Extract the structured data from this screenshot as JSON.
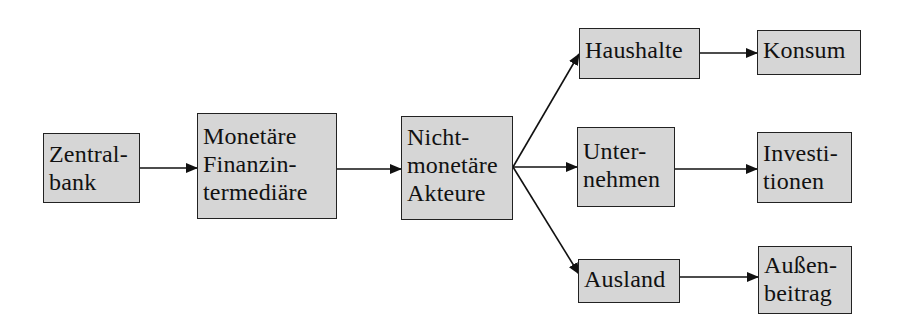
{
  "diagram": {
    "type": "flowchart",
    "direction": "left-to-right",
    "colors": {
      "node_fill": "#d6d6d6",
      "node_border": "#222222",
      "text": "#111111",
      "arrow": "#111111",
      "background": "#ffffff"
    },
    "nodes": [
      {
        "id": "zentralbank",
        "label": "Zentral-\nbank"
      },
      {
        "id": "monetaere",
        "label": "Monetäre\nFinanzin-\ntermediäre"
      },
      {
        "id": "nichtmonetaere",
        "label": "Nicht-\nmonetäre\nAkteure"
      },
      {
        "id": "haushalte",
        "label": "Haushalte"
      },
      {
        "id": "unternehmen",
        "label": "Unter-\nnehmen"
      },
      {
        "id": "ausland",
        "label": "Ausland"
      },
      {
        "id": "konsum",
        "label": "Konsum"
      },
      {
        "id": "investitionen",
        "label": "Investi-\ntionen"
      },
      {
        "id": "aussenbeitrag",
        "label": "Außen-\nbeitrag"
      }
    ],
    "edges": [
      {
        "from": "zentralbank",
        "to": "monetaere"
      },
      {
        "from": "monetaere",
        "to": "nichtmonetaere"
      },
      {
        "from": "nichtmonetaere",
        "to": "haushalte"
      },
      {
        "from": "nichtmonetaere",
        "to": "unternehmen"
      },
      {
        "from": "nichtmonetaere",
        "to": "ausland"
      },
      {
        "from": "haushalte",
        "to": "konsum"
      },
      {
        "from": "unternehmen",
        "to": "investitionen"
      },
      {
        "from": "ausland",
        "to": "aussenbeitrag"
      }
    ]
  }
}
